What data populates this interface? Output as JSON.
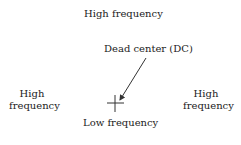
{
  "diagram": {
    "top_label": "High frequency",
    "dc_label": "Dead center (DC)",
    "left_label_line1": "High",
    "left_label_line2": "frequency",
    "right_label_line1": "High",
    "right_label_line2": "frequency",
    "bottom_label": "Low frequency"
  }
}
